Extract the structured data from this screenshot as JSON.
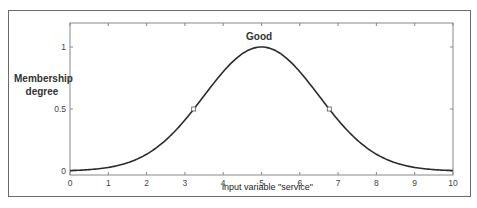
{
  "chart_data": {
    "type": "line",
    "title": "Good",
    "xlabel": "input variable \"service\"",
    "ylabel": "Membership degree",
    "xlim": [
      0,
      10
    ],
    "ylim": [
      0,
      1
    ],
    "xticks": [
      "0",
      "1",
      "2",
      "3",
      "4",
      "5",
      "6",
      "7",
      "8",
      "9",
      "10"
    ],
    "yticks": [
      "0",
      "0.5",
      "1"
    ],
    "grid": false,
    "legend": null,
    "function": "gaussian",
    "params": {
      "mean": 5,
      "sigma": 1.5
    },
    "series": [
      {
        "name": "Good",
        "x": [
          0,
          0.5,
          1,
          1.5,
          2,
          2.5,
          3,
          3.5,
          4,
          4.5,
          5,
          5.5,
          6,
          6.5,
          7,
          7.5,
          8,
          8.5,
          9,
          9.5,
          10
        ],
        "values": [
          0.004,
          0.011,
          0.029,
          0.066,
          0.135,
          0.249,
          0.411,
          0.607,
          0.801,
          0.946,
          1.0,
          0.946,
          0.801,
          0.607,
          0.411,
          0.249,
          0.135,
          0.066,
          0.029,
          0.011,
          0.004
        ]
      }
    ],
    "markers": [
      {
        "x": 3.23,
        "y": 0.5
      },
      {
        "x": 6.77,
        "y": 0.5
      }
    ]
  },
  "labels": {
    "ylabel_line1": "Membership",
    "ylabel_line2": "degree"
  },
  "colors": {
    "curve": "#2b2b2b",
    "axis": "#888888",
    "frame": "#6a6a6a"
  }
}
